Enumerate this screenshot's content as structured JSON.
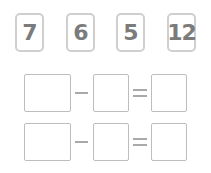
{
  "cards": [
    {
      "value": "7"
    },
    {
      "value": "6"
    },
    {
      "value": "5"
    },
    {
      "value": "12"
    }
  ],
  "equations": [
    {
      "operator": "-",
      "equals": "=",
      "operand_a": "",
      "operand_b": "",
      "result": ""
    },
    {
      "operator": "-",
      "equals": "=",
      "operand_a": "",
      "operand_b": "",
      "result": ""
    }
  ],
  "colors": {
    "card_border": "#cfcfcf",
    "digit": "#7b7b7b",
    "box_border": "#bdbdbd",
    "sign": "#a9a9a9"
  }
}
